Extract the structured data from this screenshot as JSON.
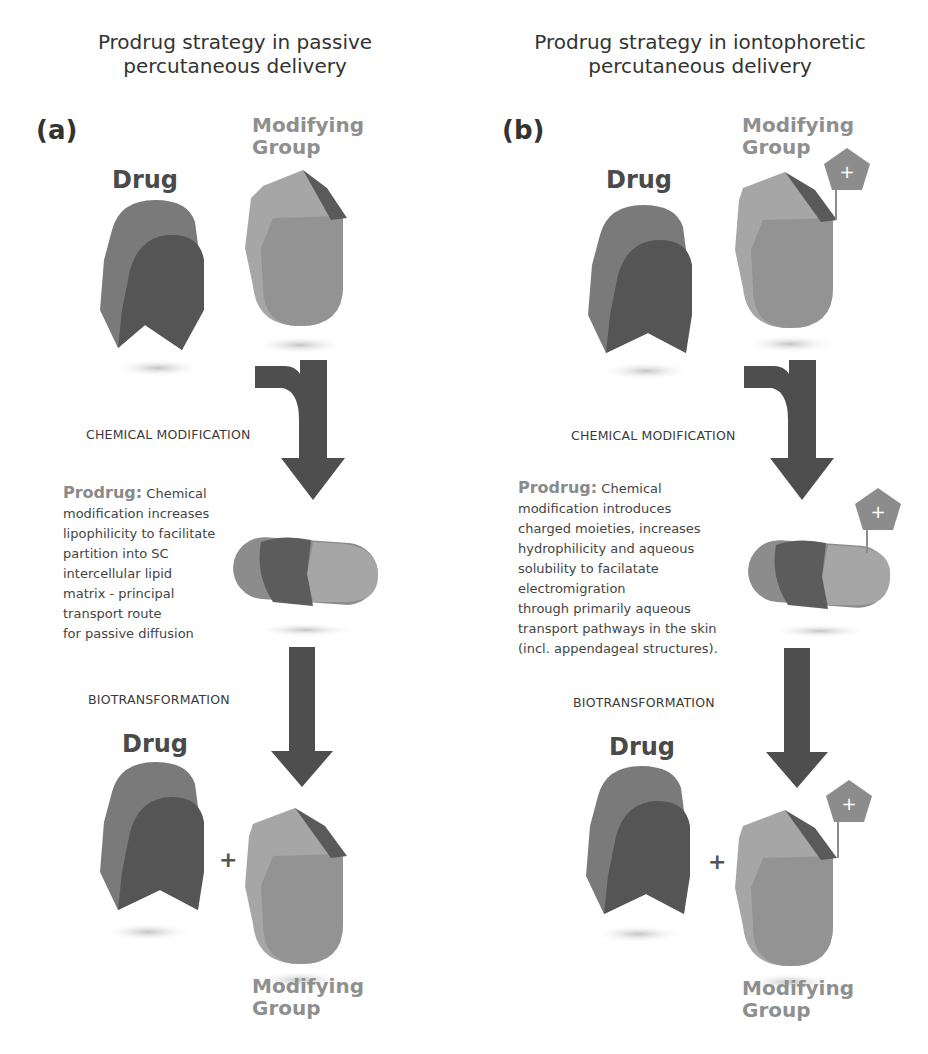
{
  "panels": [
    {
      "id": "a",
      "title_line1": "Prodrug strategy in passive",
      "title_line2": "percutaneous delivery",
      "label": "(a)",
      "top": {
        "drug_label": "Drug",
        "modifying_group_label_line1": "Modifying",
        "modifying_group_label_line2": "Group",
        "has_charge": false
      },
      "step1_label": "CHEMICAL MODIFICATION",
      "prodrug": {
        "heading": "Prodrug:",
        "lines": [
          "Chemical",
          "modification increases",
          "lipophilicity to facilitate",
          "partition into SC",
          "intercellular lipid",
          "matrix - principal",
          "transport route",
          "for passive diffusion"
        ]
      },
      "step2_label": "BIOTRANSFORMATION",
      "bottom": {
        "drug_label": "Drug",
        "plus": "+",
        "modifying_group_label_line1": "Modifying",
        "modifying_group_label_line2": "Group"
      }
    },
    {
      "id": "b",
      "title_line1": "Prodrug strategy in iontophoretic",
      "title_line2": "percutaneous delivery",
      "label": "(b)",
      "top": {
        "drug_label": "Drug",
        "modifying_group_label_line1": "Modifying",
        "modifying_group_label_line2": "Group",
        "has_charge": true,
        "charge_symbol": "+"
      },
      "step1_label": "CHEMICAL MODIFICATION",
      "prodrug": {
        "heading": "Prodrug:",
        "lines": [
          "Chemical",
          "modification introduces",
          "charged moieties, increases",
          "hydrophilicity and aqueous",
          "solubility to facilatate",
          "electromigration",
          "through primarily aqueous",
          "transport pathways in the skin",
          "(incl. appendageal structures)."
        ]
      },
      "step2_label": "BIOTRANSFORMATION",
      "bottom": {
        "drug_label": "Drug",
        "plus": "+",
        "modifying_group_label_line1": "Modifying",
        "modifying_group_label_line2": "Group",
        "charge_symbol": "+"
      }
    }
  ],
  "colors": {
    "drug_light": "#7a7a7a",
    "drug_dark": "#555555",
    "group_light": "#a6a6a6",
    "group_mid": "#8e8e8e",
    "group_dark": "#5a5a5a",
    "arrow": "#4e4e4e",
    "charge": "#8c8c8c",
    "shadow": "#cfcfcf"
  }
}
